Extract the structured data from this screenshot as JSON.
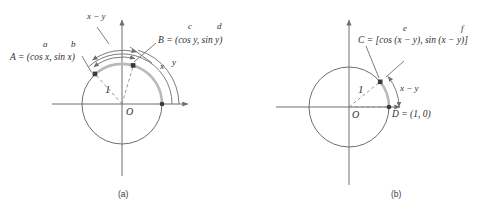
{
  "figure": {
    "panels": [
      {
        "id": "a",
        "caption": "(a)",
        "labels": {
          "point_a": "A = (cos x, sin x)",
          "point_b": "B = (cos y, sin y)",
          "arc_difference": "x − y",
          "arc_x": "x",
          "arc_y": "y",
          "radius": "1",
          "origin": "O",
          "term_a": "a",
          "term_b": "b",
          "term_c": "c",
          "term_d": "d"
        }
      },
      {
        "id": "b",
        "caption": "(b)",
        "labels": {
          "point_c": "C = [cos (x − y), sin (x − y)]",
          "point_d": "D = (1, 0)",
          "arc_difference": "x − y",
          "radius": "1",
          "origin": "O",
          "term_e": "e",
          "term_f": "f"
        }
      }
    ]
  },
  "colors": {
    "stroke": "#6e6e72",
    "highlight": "#b9b9bd",
    "text": "#2f2f33",
    "dot": "#3a3a3e",
    "background": "#ffffff"
  }
}
